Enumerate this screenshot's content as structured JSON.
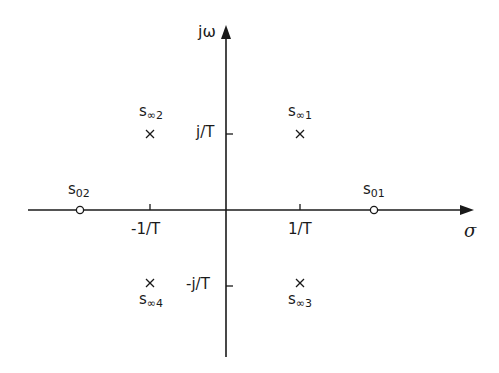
{
  "diagram": {
    "type": "s-plane pole-zero plot",
    "axes": {
      "horizontal": {
        "label": "σ"
      },
      "vertical": {
        "label": "jω"
      }
    },
    "ticks": {
      "real": [
        {
          "label": "-1/T",
          "value": -1
        },
        {
          "label": "1/T",
          "value": 1
        }
      ],
      "imag": [
        {
          "label": "j/T",
          "value": 1
        },
        {
          "label": "-j/T",
          "value": -1
        }
      ]
    },
    "poles": [
      {
        "label_main": "s",
        "label_sub": "∞1",
        "re": 1,
        "im": 1,
        "marker": "×"
      },
      {
        "label_main": "s",
        "label_sub": "∞2",
        "re": -1,
        "im": 1,
        "marker": "×"
      },
      {
        "label_main": "s",
        "label_sub": "∞3",
        "re": 1,
        "im": -1,
        "marker": "×"
      },
      {
        "label_main": "s",
        "label_sub": "∞4",
        "re": -1,
        "im": -1,
        "marker": "×"
      }
    ],
    "zeros": [
      {
        "label_main": "s",
        "label_sub": "01",
        "re": 2,
        "im": 0,
        "marker": "○"
      },
      {
        "label_main": "s",
        "label_sub": "02",
        "re": -2,
        "im": 0,
        "marker": "○"
      }
    ],
    "colors": {
      "line": "#1a1a1a",
      "background": "#ffffff"
    }
  }
}
